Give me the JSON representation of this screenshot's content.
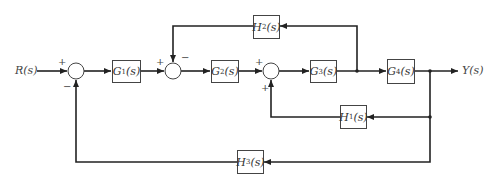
{
  "diagram": {
    "type": "control-system-block-diagram",
    "input": {
      "label": "R(s)"
    },
    "output": {
      "label": "Y(s)"
    },
    "blocks": {
      "G1": {
        "label": "G1(s)",
        "main": "G",
        "sub": "1"
      },
      "G2": {
        "label": "G2(s)",
        "main": "G",
        "sub": "2"
      },
      "G3": {
        "label": "G3(s)",
        "main": "G",
        "sub": "3"
      },
      "G4": {
        "label": "G4(s)",
        "main": "G",
        "sub": "4"
      },
      "H1": {
        "label": "H1(s)",
        "main": "H",
        "sub": "1"
      },
      "H2": {
        "label": "H2(s)",
        "main": "H",
        "sub": "2"
      },
      "H3": {
        "label": "H3(s)",
        "main": "H",
        "sub": "3"
      }
    },
    "junctions": [
      {
        "id": "S1",
        "signs": {
          "left": "+",
          "bottom": "−"
        }
      },
      {
        "id": "S2",
        "signs": {
          "left": "+",
          "top": "−"
        }
      },
      {
        "id": "S3",
        "signs": {
          "left": "+",
          "bottom": "+"
        }
      }
    ],
    "signals": [
      {
        "from": "R(s)",
        "to": "S1"
      },
      {
        "from": "S1",
        "to": "G1"
      },
      {
        "from": "G1",
        "to": "S2"
      },
      {
        "from": "S2",
        "to": "G2"
      },
      {
        "from": "G2",
        "to": "S3"
      },
      {
        "from": "S3",
        "to": "G3"
      },
      {
        "from": "G3",
        "to": "G4"
      },
      {
        "from": "G4",
        "to": "Y(s)"
      },
      {
        "from": "G3 output",
        "to": "H2",
        "to_after": "S2 (−)"
      },
      {
        "from": "Y(s)",
        "to": "H1",
        "to_after": "S3 (+)"
      },
      {
        "from": "Y(s)",
        "to": "H3",
        "to_after": "S1 (−)"
      }
    ],
    "colors": {
      "line": "#222222",
      "text": "#444444",
      "background": "#ffffff"
    },
    "s_text": "(s)"
  }
}
